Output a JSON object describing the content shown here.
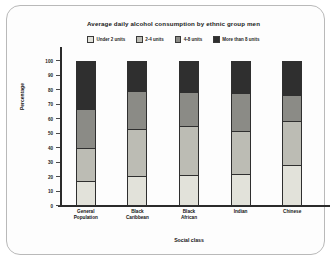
{
  "chart_data": {
    "type": "bar",
    "subtype": "stacked-100",
    "title": "Average daily alcohol consumption by ethnic group men",
    "xlabel": "Social class",
    "ylabel": "Percentage",
    "ylim": [
      0,
      100
    ],
    "yticks": [
      0,
      10,
      20,
      30,
      40,
      50,
      60,
      70,
      80,
      90,
      100
    ],
    "grid": false,
    "legend_position": "top-center",
    "categories": [
      "General\nPopulation",
      "Black\nCaribbean",
      "Black\nAfrican",
      "Indian",
      "Chinese"
    ],
    "category_labels": [
      [
        "General",
        "Population"
      ],
      [
        "Black",
        "Caribbean"
      ],
      [
        "Black",
        "African"
      ],
      [
        "Indian"
      ],
      [
        "Chinese"
      ]
    ],
    "series": [
      {
        "name": "Under 2 units",
        "color": "#e2e2da",
        "values": [
          17,
          20,
          21,
          22,
          28
        ]
      },
      {
        "name": "2-4 units",
        "color": "#bcbcb4",
        "values": [
          23,
          33,
          34,
          30,
          31
        ]
      },
      {
        "name": "4-8 units",
        "color": "#8b8b86",
        "values": [
          27,
          27,
          24,
          26,
          18
        ]
      },
      {
        "name": "More than 8 units",
        "color": "#2f2f2f",
        "values": [
          33,
          20,
          21,
          22,
          23
        ]
      }
    ],
    "cumulative_boundaries": [
      [
        17,
        40,
        67,
        100
      ],
      [
        20,
        53,
        80,
        100
      ],
      [
        21,
        55,
        79,
        100
      ],
      [
        22,
        52,
        78,
        100
      ],
      [
        28,
        59,
        77,
        100
      ]
    ]
  }
}
